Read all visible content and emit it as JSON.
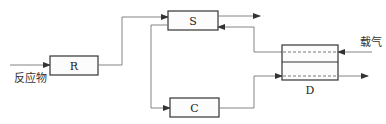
{
  "diagram": {
    "type": "process-flow",
    "nodes": {
      "R": {
        "label": "R"
      },
      "S": {
        "label": "S"
      },
      "C": {
        "label": "C"
      },
      "D": {
        "label": "D"
      }
    },
    "inputs": {
      "reactant": "反应物",
      "carrier_gas": "载气"
    },
    "edges": [
      {
        "from": "reactant",
        "to": "R"
      },
      {
        "from": "R",
        "to": "S"
      },
      {
        "from": "S",
        "to": "out"
      },
      {
        "from": "D",
        "to": "S"
      },
      {
        "from": "S",
        "to": "C"
      },
      {
        "from": "C",
        "to": "D"
      },
      {
        "from": "carrier_gas",
        "to": "D"
      },
      {
        "from": "D",
        "to": "out"
      }
    ]
  }
}
